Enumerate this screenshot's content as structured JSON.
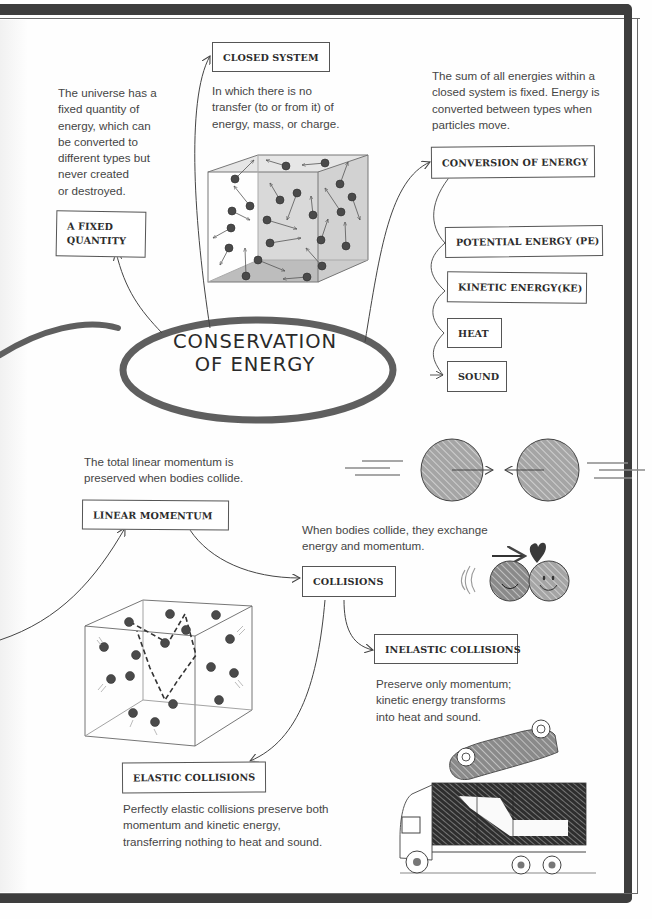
{
  "title": {
    "line1": "CONSERVATION",
    "line2": "OF ENERGY"
  },
  "nodes": {
    "fixed_quantity": {
      "label_line1": "A FIXED",
      "label_line2": "QUANTITY",
      "description": [
        "The universe has a",
        "fixed quantity of",
        "energy, which can",
        "be converted to",
        "different types but",
        "never created",
        "or destroyed."
      ]
    },
    "closed_system": {
      "label": "CLOSED SYSTEM",
      "description": [
        "In which there is no",
        "transfer (to or from it) of",
        "energy, mass, or charge."
      ]
    },
    "conversion_of_energy": {
      "label": "CONVERSION OF ENERGY",
      "description": [
        "The sum of all energies within a",
        "closed system is fixed. Energy is",
        "converted between types when",
        "particles move."
      ],
      "children": [
        {
          "label": "POTENTIAL ENERGY (PE)"
        },
        {
          "label": "KINETIC ENERGY(KE)"
        },
        {
          "label": "HEAT"
        },
        {
          "label": "SOUND"
        }
      ]
    },
    "linear_momentum": {
      "label": "LINEAR MOMENTUM",
      "description": [
        "The total linear momentum is",
        "preserved when bodies collide."
      ]
    },
    "collisions": {
      "label": "COLLISIONS",
      "description": [
        "When bodies collide, they exchange",
        "energy and momentum."
      ]
    },
    "inelastic_collisions": {
      "label": "INELASTIC COLLISIONS",
      "description": [
        "Preserve only momentum;",
        "kinetic energy transforms",
        "into heat and sound."
      ]
    },
    "elastic_collisions": {
      "label": "ELASTIC COLLISIONS",
      "description": [
        "Perfectly elastic collisions preserve both",
        "momentum and kinetic energy,",
        "transferring nothing to heat and sound."
      ]
    }
  },
  "illustrations": {
    "closed_system_cube": "cube-with-moving-particles",
    "colliding_spheres": "two-spheres-approaching",
    "smiley_collision": "two-smiley-balls-with-heart",
    "momentum_cube": "cube-with-dashed-particle-path",
    "crash": "upside-down-car-on-truck"
  },
  "colors": {
    "frame": "#3d3d3d",
    "ellipse": "#5f5f5f",
    "text": "#454545",
    "sphere": "#8c8c8c",
    "particle": "#4a4a4a"
  }
}
